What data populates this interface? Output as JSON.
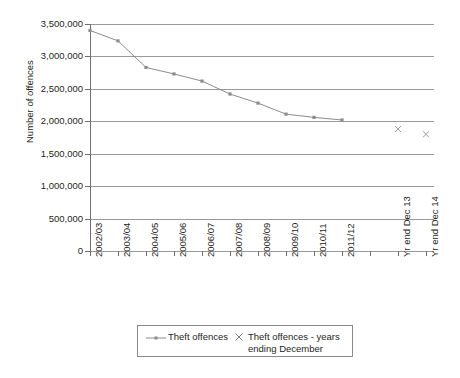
{
  "chart_data": {
    "type": "line",
    "title": "",
    "xlabel": "",
    "ylabel": "Number of offences",
    "ylim": [
      0,
      3500000
    ],
    "ytick_labels": [
      "3,500,000",
      "3,000,000",
      "2,500,000",
      "2,000,000",
      "1,500,000",
      "1,000,000",
      "500,000",
      "0"
    ],
    "ytick_values": [
      3500000,
      3000000,
      2500000,
      2000000,
      1500000,
      1000000,
      500000,
      0
    ],
    "grid": true,
    "legend_position": "bottom",
    "categories": [
      "2002/03",
      "2003/04",
      "2004/05",
      "2005/06",
      "2006/07",
      "2007/08",
      "2008/09",
      "2009/10",
      "2010/11",
      "2011/12",
      "",
      "Yr end Dec 13",
      "Yr end Dec 14"
    ],
    "series": [
      {
        "name": "Theft offences",
        "marker": "line-with-markers",
        "values": [
          3400000,
          3240000,
          2830000,
          2730000,
          2620000,
          2420000,
          2280000,
          2110000,
          2060000,
          2020000,
          null,
          null,
          null
        ]
      },
      {
        "name": "Theft offences - years ending December",
        "marker": "x",
        "values": [
          null,
          null,
          null,
          null,
          null,
          null,
          null,
          null,
          null,
          null,
          null,
          1880000,
          1800000
        ]
      }
    ]
  },
  "legend": {
    "entries": [
      {
        "label": "Theft offences",
        "marker": "line-marker"
      },
      {
        "label": "Theft offences - years ending December",
        "marker": "x-marker"
      }
    ]
  },
  "colors": {
    "series_line": "#8c8c8c",
    "series_marker": "#8c8c8c",
    "cross_marker": "#9b9b9b",
    "gridline": "#9a9a9a",
    "axis": "#6f6f6f",
    "text": "#231f20",
    "background": "#ffffff"
  }
}
